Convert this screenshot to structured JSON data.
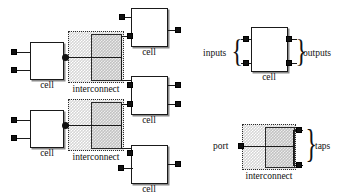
{
  "figure": {
    "title": "",
    "left_diagram": {
      "name": "netlist-composition",
      "cells": [
        {
          "id": "cell-left-top",
          "label": "cell",
          "x": 30,
          "y": 42,
          "w": 34,
          "h": 38,
          "inputs": 2,
          "outputs": 1
        },
        {
          "id": "cell-left-bottom",
          "label": "cell",
          "x": 30,
          "y": 110,
          "w": 34,
          "h": 38,
          "inputs": 2,
          "outputs": 1
        },
        {
          "id": "cell-right-top",
          "label": "cell",
          "x": 131,
          "y": 8,
          "w": 37,
          "h": 39,
          "inputs": 2,
          "outputs": 1
        },
        {
          "id": "cell-right-middle",
          "label": "cell",
          "x": 131,
          "y": 76,
          "w": 37,
          "h": 39,
          "inputs": 2,
          "outputs": 2
        },
        {
          "id": "cell-right-bottom",
          "label": "cell",
          "x": 131,
          "y": 145,
          "w": 37,
          "h": 39,
          "inputs": 2,
          "outputs": 1
        }
      ],
      "interconnects": [
        {
          "id": "interconnect-top",
          "label": "interconnect",
          "x": 68,
          "y": 31,
          "w": 56,
          "h": 52
        },
        {
          "id": "interconnect-bottom",
          "label": "interconnect",
          "x": 68,
          "y": 99,
          "w": 56,
          "h": 52
        }
      ]
    },
    "legend": {
      "cell_legend": {
        "name": "cell-legend",
        "box_label": "cell",
        "inputs_label": "inputs",
        "outputs_label": "outputs",
        "inputs_count": 2,
        "outputs_count": 2
      },
      "interconnect_legend": {
        "name": "interconnect-legend",
        "box_label": "interconnect",
        "port_label": "port",
        "taps_label": "taps",
        "ports_count": 1,
        "taps_count": 2
      }
    },
    "colors": {
      "ink": "#111111",
      "box_fill": "#ffffff",
      "box_stroke": "#1a1a1a",
      "shadow": "#8a8a8a",
      "hatch_light": "#d6d6d6",
      "hatch_dark": "#c2c2c2",
      "dotted_stroke": "#2b2b2b"
    }
  }
}
